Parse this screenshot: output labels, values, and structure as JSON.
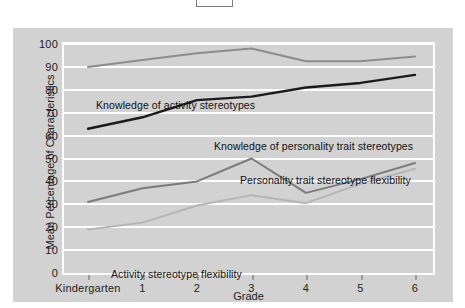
{
  "chart_data": {
    "type": "line",
    "title": "",
    "xlabel": "Grade",
    "ylabel": "Mean Percentage of Characteristics",
    "categories": [
      "Kindergarten",
      "1",
      "2",
      "3",
      "4",
      "5",
      "6"
    ],
    "ylim": [
      0,
      100
    ],
    "ytick_labels": [
      "100",
      "90",
      "80",
      "70",
      "60",
      "50",
      "40",
      "30",
      "20",
      "10",
      "0"
    ],
    "ytick_values": [
      100,
      90,
      80,
      70,
      60,
      50,
      40,
      30,
      20,
      10,
      0
    ],
    "grid": true,
    "legend": "inline-annotations",
    "series": [
      {
        "name": "Knowledge of activity stereotypes",
        "color": "#8c8c8c",
        "values": [
          90,
          93,
          96,
          98,
          92.5,
          92.5,
          94.5
        ]
      },
      {
        "name": "Knowledge of personality trait stereotypes",
        "color": "#1a1a1a",
        "values": [
          63,
          68,
          75.5,
          77,
          81,
          83,
          86.5
        ]
      },
      {
        "name": "Personality trait stereotype flexibility",
        "color": "#7b7b7b",
        "values": [
          31,
          37,
          40,
          50,
          35,
          41,
          48
        ]
      },
      {
        "name": "Activity stereotype flexibility",
        "color": "#b5b5b5",
        "values": [
          19,
          22,
          29.5,
          34,
          30.5,
          39,
          45.5
        ]
      }
    ],
    "annotations": [
      {
        "text": "Knowledge of activity stereotypes",
        "x_px": 83,
        "y_px": 71
      },
      {
        "text": "Knowledge of personality trait stereotypes",
        "x_px": 201,
        "y_px": 112
      },
      {
        "text": "Personality trait stereotype flexibility",
        "x_px": 227,
        "y_px": 146
      },
      {
        "text": "Activity stereotype flexibility",
        "x_px": 98,
        "y_px": 240
      }
    ],
    "colors": {
      "panel_background": "#d2d2d2",
      "gridline": "#ffffff",
      "plot_border": "#ffffff",
      "text": "#1c1c1c",
      "page_background": "#ffffff"
    }
  }
}
